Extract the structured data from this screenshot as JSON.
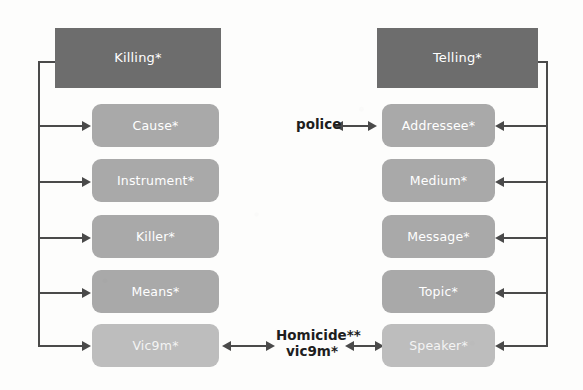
{
  "diagram": {
    "title_left": "Killing*",
    "title_right": "Telling*",
    "background_color": "#fdfdfc",
    "frame_node_color": "#6d6d6d",
    "role_node_color": "#a9a9a9",
    "role_node_light_color": "#bdbdbd",
    "connector_color": "#4a4a4a",
    "left_frame": {
      "name": "Killing*",
      "roles": [
        {
          "label": "Cause*",
          "shade": "normal"
        },
        {
          "label": "Instrument*",
          "shade": "normal"
        },
        {
          "label": "Killer*",
          "shade": "normal"
        },
        {
          "label": "Means*",
          "shade": "normal"
        },
        {
          "label": "Vic9m*",
          "shade": "light"
        }
      ]
    },
    "right_frame": {
      "name": "Telling*",
      "roles": [
        {
          "label": "Addressee*",
          "shade": "normal"
        },
        {
          "label": "Medium*",
          "shade": "normal"
        },
        {
          "label": "Message*",
          "shade": "normal"
        },
        {
          "label": "Topic*",
          "shade": "normal"
        },
        {
          "label": "Speaker*",
          "shade": "light"
        }
      ]
    },
    "annotations": {
      "police": "police",
      "bridge_line1": "Homicide**",
      "bridge_line2": "vic9m*"
    }
  }
}
